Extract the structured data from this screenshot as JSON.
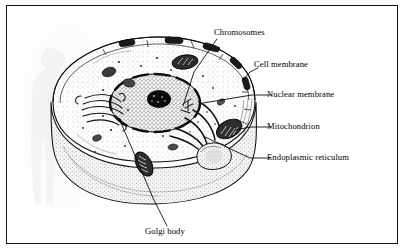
{
  "figure": {
    "kind": "biology-diagram",
    "border_color": "#111111",
    "background_color": "#fefefe",
    "ink_color": "#000000"
  },
  "labels": [
    {
      "id": "chromosomes",
      "text": "Chromosomes",
      "x": 213,
      "y": 27,
      "anchor": "start"
    },
    {
      "id": "cell-membrane",
      "text": "Cell membrane",
      "x": 253,
      "y": 59,
      "anchor": "start"
    },
    {
      "id": "nuclear-membrane",
      "text": "Nuclear membrane",
      "x": 266,
      "y": 92,
      "anchor": "start"
    },
    {
      "id": "mitochondrion",
      "text": "Mitochondrion",
      "x": 266,
      "y": 124,
      "anchor": "start"
    },
    {
      "id": "endoplasmic-reticulum",
      "text": "Endoplasmic reticulum",
      "x": 266,
      "y": 155,
      "anchor": "start"
    },
    {
      "id": "golgi-body",
      "text": "Golgi body",
      "x": 144,
      "y": 227,
      "anchor": "start"
    }
  ],
  "leaders": [
    {
      "id": "leader-chromosomes",
      "points": "210,33 187,66 176,100"
    },
    {
      "id": "leader-cell-membrane",
      "points": "251,62 243,66 236,74"
    },
    {
      "id": "leader-nuclear-membrane",
      "points": "264,89 245,89 196,97"
    },
    {
      "id": "leader-mitochondrion",
      "points": "264,121 244,121 228,124"
    },
    {
      "id": "leader-endoplasmic-reticulum",
      "points": "264,152 243,152 198,131"
    },
    {
      "id": "leader-golgi-body",
      "points": "160,220 146,192 112,112"
    }
  ],
  "structures": [
    {
      "id": "cell-membrane-rim",
      "name": "cell membrane"
    },
    {
      "id": "cytoplasm",
      "name": "cytoplasm"
    },
    {
      "id": "nucleus",
      "name": "nucleus"
    },
    {
      "id": "nucleolus",
      "name": "nucleolus / chromosomes"
    },
    {
      "id": "nuclear-membrane-ring",
      "name": "nuclear membrane"
    },
    {
      "id": "golgi-apparatus",
      "name": "golgi body"
    },
    {
      "id": "endoplasmic-reticulum",
      "name": "endoplasmic reticulum"
    },
    {
      "id": "mitochondrion-right",
      "name": "mitochondrion"
    },
    {
      "id": "mitochondrion-left",
      "name": "mitochondrion"
    },
    {
      "id": "vacuole",
      "name": "vacuole"
    },
    {
      "id": "ghost-figure",
      "name": "faint human silhouette bleed-through"
    }
  ]
}
